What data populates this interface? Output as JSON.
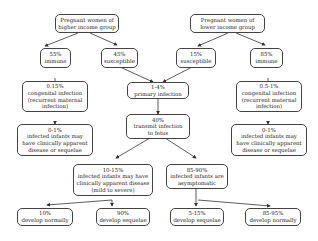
{
  "nodes": {
    "high_income": [
      "Pregnant women of",
      "higher income group"
    ],
    "low_income": [
      "Pregnant women of",
      "lower income group"
    ],
    "high_immune": [
      "55%",
      "immune"
    ],
    "high_susceptible": [
      "45%",
      "susceptible"
    ],
    "low_susceptible": [
      "15%",
      "susceptible"
    ],
    "low_immune": [
      "85%",
      "immune"
    ],
    "primary_infection": [
      "1-4%",
      "primary infection"
    ],
    "transmit": [
      "40%",
      "transmit infection",
      "to fetus"
    ],
    "high_congenital": [
      "0.15%",
      "congenital infection",
      "(recurrent maternal",
      "infection)"
    ],
    "high_infected": [
      "0-1%",
      "infected infants may",
      "have clinically apparent",
      "disease or sequelae"
    ],
    "low_congenital": [
      "0.5-1%",
      "congenital infection",
      "(recurrent maternal",
      "infection)"
    ],
    "low_infected": [
      "0-1%",
      "infected infants may",
      "have clinically apparent",
      "disease or sequelae"
    ],
    "apparent": [
      "10-15%",
      "infected infants may have",
      "clinically apparent disease",
      "(mild to severe)"
    ],
    "asymptomatic": [
      "85-90%",
      "infected infants are",
      "asymptomatic"
    ],
    "apparent_normal": [
      "10%",
      "develop normally"
    ],
    "apparent_sequelae": [
      "90%",
      "develop sequelae"
    ],
    "asym_sequelae": [
      "5-15%",
      "develop sequelae"
    ],
    "asym_normal": [
      "85-95%",
      "develop normally"
    ]
  }
}
